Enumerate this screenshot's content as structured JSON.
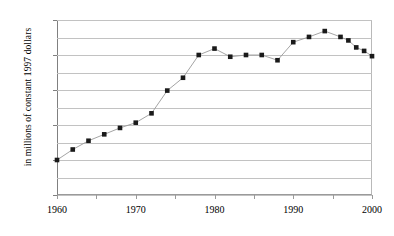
{
  "chart_data": {
    "type": "line",
    "title": "",
    "subtitle": "",
    "xlabel": "",
    "ylabel": "in millions of constant 1997 dollars",
    "x": [
      1960,
      1962,
      1964,
      1966,
      1968,
      1970,
      1972,
      1974,
      1976,
      1978,
      1980,
      1982,
      1984,
      1986,
      1988,
      1990,
      1992,
      1994,
      1996,
      1997,
      1998,
      1999,
      2000
    ],
    "values": [
      300,
      390,
      465,
      520,
      575,
      620,
      700,
      895,
      1005,
      1200,
      1255,
      1185,
      1200,
      1200,
      1155,
      1310,
      1355,
      1405,
      1355,
      1325,
      1265,
      1235,
      1190
    ],
    "series": [
      {
        "name": "",
        "values": [
          300,
          390,
          465,
          520,
          575,
          620,
          700,
          895,
          1005,
          1200,
          1255,
          1185,
          1200,
          1200,
          1155,
          1310,
          1355,
          1405,
          1355,
          1325,
          1265,
          1235,
          1190
        ]
      }
    ],
    "xlim": [
      1960,
      2000
    ],
    "ylim": [
      0,
      1500
    ],
    "y_major_ticks": [
      0,
      300,
      600,
      900,
      1200,
      1500
    ],
    "y_gridline_values": [
      0,
      150,
      300,
      450,
      600,
      750,
      900,
      1050,
      1200,
      1350,
      1500
    ],
    "x_tick_labels": [
      1960,
      1970,
      1980,
      1990,
      2000
    ],
    "x_minor_ticks": [
      1965,
      1975,
      1985,
      1995
    ],
    "grid": "horizontal",
    "legend": "none",
    "marker": "square",
    "marker_color": "#1a1a1a",
    "line_color": "#9a9a9a",
    "background": "#ffffff",
    "annotations": []
  },
  "axis": {
    "y_labels": [
      "1500",
      "1200",
      "900",
      "600",
      "300",
      "0"
    ],
    "x_labels": [
      "1960",
      "1970",
      "1980",
      "1990",
      "2000"
    ],
    "y_title": "in millions of constant 1997 dollars"
  }
}
